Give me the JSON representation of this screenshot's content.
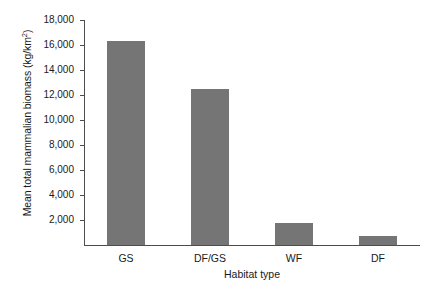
{
  "chart_data": {
    "type": "bar",
    "title": "",
    "subtitle": "",
    "categories": [
      "GS",
      "DF/GS",
      "WF",
      "DF"
    ],
    "values": [
      16300,
      12500,
      1750,
      750
    ],
    "series": [
      {
        "name": "Mean total mammalian biomass",
        "values": [
          16300,
          12500,
          1750,
          750
        ]
      }
    ],
    "xlabel": "Habitat type",
    "ylabel": "Mean total mammalian biomass (kg/km",
    "ylabel_superscript": "2",
    "ylabel_suffix": ")",
    "ylim": [
      0,
      18000
    ],
    "yticks": [
      2000,
      4000,
      6000,
      8000,
      10000,
      12000,
      14000,
      16000,
      18000
    ],
    "ytick_labels": [
      "2,000",
      "4,000",
      "6,000",
      "8,000",
      "10,000",
      "12,000",
      "14,000",
      "16,000",
      "18,000"
    ],
    "grid": false,
    "legend": false,
    "legend_position": "none",
    "bar_color": "#757575",
    "axis_color": "#4d4d4d",
    "background_color": "#ffffff"
  }
}
